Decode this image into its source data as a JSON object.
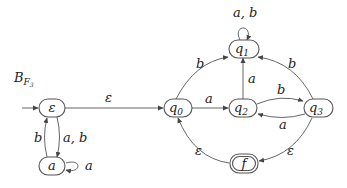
{
  "title": {
    "main": "B",
    "subscript": "F",
    "subsub": "3"
  },
  "nodes": [
    {
      "id": "eps",
      "label": "ε",
      "initial": true,
      "final": false
    },
    {
      "id": "a",
      "label": "a",
      "initial": false,
      "final": false
    },
    {
      "id": "q0",
      "label": "q",
      "sub": "0",
      "initial": false,
      "final": false
    },
    {
      "id": "q1",
      "label": "q",
      "sub": "1",
      "initial": false,
      "final": false
    },
    {
      "id": "q2",
      "label": "q",
      "sub": "2",
      "initial": false,
      "final": false
    },
    {
      "id": "q3",
      "label": "q",
      "sub": "3",
      "initial": false,
      "final": false
    },
    {
      "id": "f",
      "label": "f",
      "initial": false,
      "final": true
    }
  ],
  "edges": [
    {
      "from": "eps",
      "to": "q0",
      "label": "ε"
    },
    {
      "from": "eps",
      "to": "a",
      "label": "a, b"
    },
    {
      "from": "a",
      "to": "eps",
      "label": "b"
    },
    {
      "from": "a",
      "to": "a",
      "label": "a"
    },
    {
      "from": "q0",
      "to": "q1",
      "label": "b"
    },
    {
      "from": "q0",
      "to": "q2",
      "label": "a"
    },
    {
      "from": "q2",
      "to": "q1",
      "label": "a"
    },
    {
      "from": "q2",
      "to": "q3",
      "label": "b"
    },
    {
      "from": "q3",
      "to": "q2",
      "label": "a"
    },
    {
      "from": "q3",
      "to": "q1",
      "label": "b"
    },
    {
      "from": "q1",
      "to": "q1",
      "label": "a, b"
    },
    {
      "from": "q3",
      "to": "f",
      "label": "ε"
    },
    {
      "from": "f",
      "to": "q0",
      "label": "ε"
    }
  ]
}
